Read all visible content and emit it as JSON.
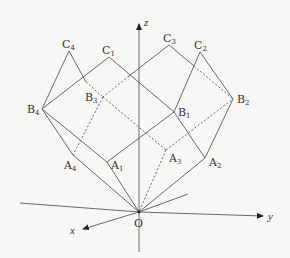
{
  "diagram": {
    "type": "3d-geometry-solid",
    "axes": {
      "x": {
        "label": "x"
      },
      "y": {
        "label": "y"
      },
      "z": {
        "label": "z"
      },
      "origin": {
        "label": "O"
      }
    },
    "points": {
      "A1": {
        "base": "A",
        "sub": "1"
      },
      "A2": {
        "base": "A",
        "sub": "2"
      },
      "A3": {
        "base": "A",
        "sub": "3"
      },
      "A4": {
        "base": "A",
        "sub": "4"
      },
      "B1": {
        "base": "B",
        "sub": "1"
      },
      "B2": {
        "base": "B",
        "sub": "2"
      },
      "B3": {
        "base": "B",
        "sub": "3"
      },
      "B4": {
        "base": "B",
        "sub": "4"
      },
      "C1": {
        "base": "C",
        "sub": "1"
      },
      "C2": {
        "base": "C",
        "sub": "2"
      },
      "C3": {
        "base": "C",
        "sub": "3"
      },
      "C4": {
        "base": "C",
        "sub": "4"
      }
    },
    "colors": {
      "line": "#6a6a6a",
      "text": "#333333",
      "background": "#f7f7f5"
    }
  }
}
